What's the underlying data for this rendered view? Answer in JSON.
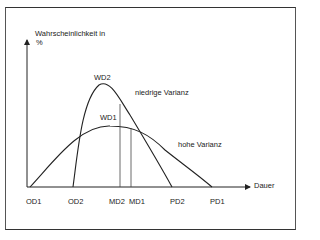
{
  "diagram": {
    "y_axis_label_line1": "Wahrscheinlichkeit in",
    "y_axis_label_line2": "%",
    "x_axis_label": "Dauer",
    "curves": [
      {
        "name": "WD2",
        "annotation": "niedrige Varianz",
        "start": "OD2",
        "mode": "MD2",
        "end": "PD2"
      },
      {
        "name": "WD1",
        "annotation": "hohe Varianz",
        "start": "OD1",
        "mode": "MD1",
        "end": "PD1"
      }
    ],
    "peak_labels": {
      "wd2": "WD2",
      "wd1": "WD1"
    },
    "annotations": {
      "low_variance": "niedrige Varianz",
      "high_variance": "hohe Varianz"
    },
    "x_ticks": {
      "od1": "OD1",
      "od2": "OD2",
      "md2": "MD2",
      "md1": "MD1",
      "pd2": "PD2",
      "pd1": "PD1"
    },
    "colors": {
      "line": "#222222",
      "frame": "#444444",
      "background": "#ffffff"
    }
  }
}
